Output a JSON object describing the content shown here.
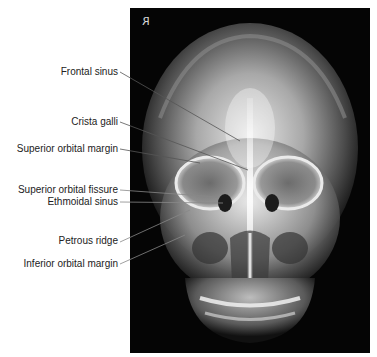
{
  "figure": {
    "orientation_marker": "R",
    "image_type": "Frontal skull radiograph (PA view)"
  },
  "labels": [
    {
      "text": "Frontal sinus",
      "y": 72,
      "line": [
        120,
        72,
        240,
        141
      ]
    },
    {
      "text": "Crista galli",
      "y": 122,
      "line": [
        120,
        122,
        248,
        170
      ]
    },
    {
      "text": "Superior orbital margin",
      "y": 149,
      "line": [
        120,
        149,
        200,
        163
      ]
    },
    {
      "text": "Superior orbital fissure",
      "y": 190,
      "line": [
        120,
        190,
        218,
        197
      ]
    },
    {
      "text": "Ethmoidal sinus",
      "y": 202,
      "line": [
        120,
        202,
        223,
        203
      ]
    },
    {
      "text": "Petrous ridge",
      "y": 241,
      "line": [
        120,
        242,
        190,
        210
      ]
    },
    {
      "text": "Inferior orbital margin",
      "y": 264,
      "line": [
        120,
        264,
        185,
        235
      ]
    }
  ]
}
